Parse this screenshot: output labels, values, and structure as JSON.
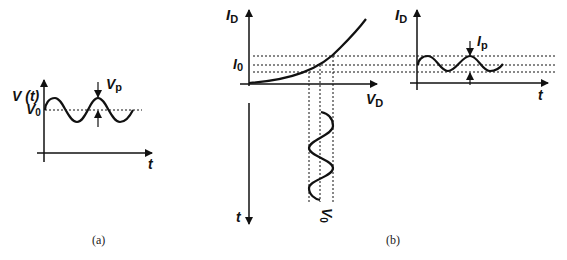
{
  "figure_a": {
    "caption": "(a)",
    "y_axis_label": "V (t)",
    "x_axis_label": "t",
    "dc_level_label": "V",
    "dc_level_sub": "0",
    "amplitude_label": "V",
    "amplitude_sub": "p"
  },
  "figure_b": {
    "caption": "(b)",
    "characteristic": {
      "y_axis_label": "I",
      "y_axis_sub": "D",
      "x_axis_label": "V",
      "x_axis_sub": "D",
      "bias_current_label": "I",
      "bias_current_sub": "0"
    },
    "input_waveform": {
      "time_axis_label": "t",
      "dc_level_label": "V",
      "dc_level_sub": "0"
    },
    "output_waveform": {
      "y_axis_label": "I",
      "y_axis_sub": "D",
      "x_axis_label": "t",
      "amplitude_label": "I",
      "amplitude_sub": "p"
    }
  },
  "colors": {
    "stroke": "#111111",
    "background": "#ffffff"
  }
}
